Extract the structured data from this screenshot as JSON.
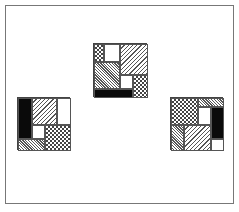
{
  "figure": {
    "frame": {
      "border_color": "#777777"
    },
    "patterns": {
      "black": "solid black",
      "white": "blank",
      "diag-wide": "wide diagonal hatching",
      "diag-fine": "fine diagonal hatching",
      "check": "crosshatch / checker"
    },
    "squares": [
      {
        "id": "top",
        "position": {
          "x": 93,
          "y": 43,
          "size": 54
        },
        "pieces": [
          {
            "pattern": "check",
            "x": 0,
            "y": 0,
            "w": 10,
            "h": 18
          },
          {
            "pattern": "white",
            "x": 10,
            "y": 0,
            "w": 16,
            "h": 18
          },
          {
            "pattern": "diag-wide",
            "x": 26,
            "y": 0,
            "w": 28,
            "h": 31
          },
          {
            "pattern": "diag-fine",
            "x": 0,
            "y": 18,
            "w": 26,
            "h": 27
          },
          {
            "pattern": "white",
            "x": 26,
            "y": 31,
            "w": 13,
            "h": 14
          },
          {
            "pattern": "check",
            "x": 39,
            "y": 31,
            "w": 15,
            "h": 23
          },
          {
            "pattern": "black",
            "x": 0,
            "y": 45,
            "w": 39,
            "h": 9
          }
        ]
      },
      {
        "id": "left",
        "position": {
          "x": 17,
          "y": 97,
          "size": 53
        },
        "pieces": [
          {
            "pattern": "black",
            "x": 0,
            "y": 0,
            "w": 14,
            "h": 41
          },
          {
            "pattern": "diag-wide",
            "x": 14,
            "y": 0,
            "w": 25,
            "h": 27
          },
          {
            "pattern": "white",
            "x": 39,
            "y": 0,
            "w": 14,
            "h": 27
          },
          {
            "pattern": "white",
            "x": 14,
            "y": 27,
            "w": 13,
            "h": 14
          },
          {
            "pattern": "check",
            "x": 27,
            "y": 27,
            "w": 26,
            "h": 26
          },
          {
            "pattern": "diag-fine",
            "x": 0,
            "y": 41,
            "w": 27,
            "h": 12
          }
        ]
      },
      {
        "id": "right",
        "position": {
          "x": 170,
          "y": 97,
          "size": 53
        },
        "pieces": [
          {
            "pattern": "check",
            "x": 0,
            "y": 0,
            "w": 27,
            "h": 27
          },
          {
            "pattern": "diag-fine",
            "x": 27,
            "y": 0,
            "w": 26,
            "h": 9
          },
          {
            "pattern": "white",
            "x": 27,
            "y": 9,
            "w": 13,
            "h": 18
          },
          {
            "pattern": "black",
            "x": 40,
            "y": 9,
            "w": 13,
            "h": 32
          },
          {
            "pattern": "diag-fine",
            "x": 0,
            "y": 27,
            "w": 13,
            "h": 26
          },
          {
            "pattern": "diag-wide",
            "x": 13,
            "y": 27,
            "w": 27,
            "h": 26
          },
          {
            "pattern": "white",
            "x": 40,
            "y": 41,
            "w": 13,
            "h": 12
          }
        ]
      }
    ]
  }
}
